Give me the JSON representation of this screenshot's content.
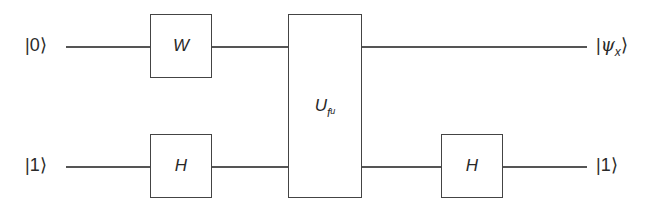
{
  "circuit": {
    "inputs": [
      {
        "qubit": 0,
        "label": "0"
      },
      {
        "qubit": 1,
        "label": "1"
      }
    ],
    "outputs": [
      {
        "qubit": 0,
        "label": "ψ",
        "subscript": "x"
      },
      {
        "qubit": 1,
        "label": "1"
      }
    ],
    "gates": [
      {
        "id": "w",
        "label": "W",
        "qubits": [
          0
        ]
      },
      {
        "id": "h1",
        "label": "H",
        "qubits": [
          1
        ]
      },
      {
        "id": "u",
        "label": "U",
        "subscript": "f",
        "subsubscript": "u",
        "qubits": [
          0,
          1
        ]
      },
      {
        "id": "h2",
        "label": "H",
        "qubits": [
          1
        ]
      }
    ]
  }
}
